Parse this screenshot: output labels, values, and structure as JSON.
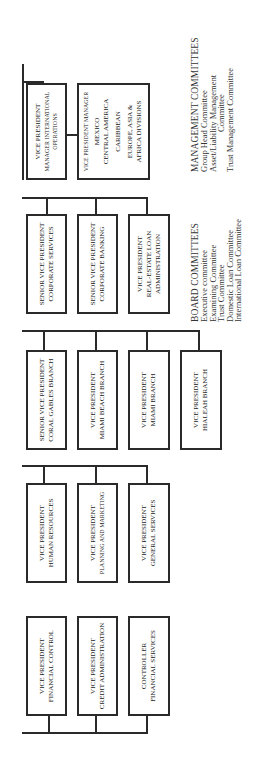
{
  "orientation": "rotated-90-counterclockwise",
  "groups": [
    {
      "id": "international",
      "boxes": [
        {
          "lines": [
            "VICE PRESIDENT",
            "MANAGER INTERNATIONAL",
            "OPERATIONS"
          ]
        },
        {
          "lines": [
            "VICE PRESIDENT MANAGER",
            "MEXICO",
            "CENTRAL AMERICA",
            "CARIBBEAN",
            "EUROPE, ASIA &",
            "AFRICA DIVISIONS"
          ]
        }
      ]
    },
    {
      "id": "corporate",
      "boxes": [
        {
          "lines": [
            "SENIOR VICE PRESIDENT",
            "CORPORATE SERVICES"
          ]
        },
        {
          "lines": [
            "SENIOR VICE PRESIDENT",
            "CORPORATE BANKING"
          ]
        },
        {
          "lines": [
            "VICE PRESIDENT",
            "REAL-ESTATE LOAN",
            "ADMINISTRATION"
          ]
        }
      ]
    },
    {
      "id": "branches",
      "boxes": [
        {
          "lines": [
            "SENIOR VICE PRESIDENT",
            "CORAL GABLES BRANCH"
          ]
        },
        {
          "lines": [
            "VICE PRESIDENT",
            "MIAMI BEACH BRANCH"
          ]
        },
        {
          "lines": [
            "VICE PRESIDENT",
            "MIAMI BRANCH"
          ]
        },
        {
          "lines": [
            "VICE PRESIDENT",
            "HIALEAH BRANCH"
          ]
        }
      ]
    },
    {
      "id": "administration",
      "boxes": [
        {
          "lines": [
            "VICE PRESIDENT",
            "HUMAN RESOURCES"
          ]
        },
        {
          "lines": [
            "VICE PRESIDENT",
            "PLANNING AND MARKETING"
          ]
        },
        {
          "lines": [
            "VICE PRESIDENT",
            "GENERAL SERVICES"
          ]
        }
      ]
    },
    {
      "id": "finance",
      "boxes": [
        {
          "lines": [
            "VICE PRESIDENT",
            "FINANCIAL CONTROL"
          ]
        },
        {
          "lines": [
            "VICE PRESIDENT",
            "CREDIT ADMINISTRATION"
          ]
        },
        {
          "lines": [
            "CONTROLLER",
            "FINANCIAL SERVICES"
          ]
        }
      ]
    }
  ],
  "management_committees": {
    "title": "MANAGEMENT COMMITTEES",
    "items": [
      "Group Head Committee",
      "Asset/Liability Management",
      "Committee",
      "Trust Management Committee"
    ]
  },
  "board_committees": {
    "title": "BOARD COMMITTEES",
    "items": [
      "Executive committee",
      "Examining Committee",
      "Trust Committee",
      "Domestic Loan Committee",
      "International Loan Committee"
    ]
  },
  "colors": {
    "line": "#2a2a2a",
    "text": "#222222",
    "background": "#ffffff"
  }
}
